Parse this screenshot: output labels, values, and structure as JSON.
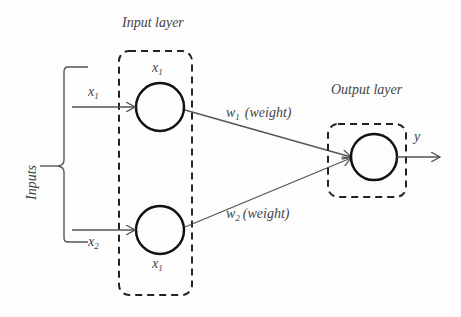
{
  "diagram": {
    "input_layer": {
      "title": "Input layer",
      "node1_label": "x",
      "node1_sub": "1",
      "node2_label": "x",
      "node2_sub": "1"
    },
    "inputs": {
      "brace_label": "Inputs",
      "x1": "x",
      "x1_sub": "1",
      "x2": "x",
      "x2_sub": "2"
    },
    "weights": {
      "w1": "w",
      "w1_sub": "1",
      "w1_text": "(weight)",
      "w2": "w",
      "w2_sub": "2",
      "w2_text": "(weight)"
    },
    "output_layer": {
      "title": "Output layer",
      "output_label": "y"
    },
    "colors": {
      "node_stroke": "#111111",
      "line": "#555555",
      "text": "#444444"
    }
  }
}
